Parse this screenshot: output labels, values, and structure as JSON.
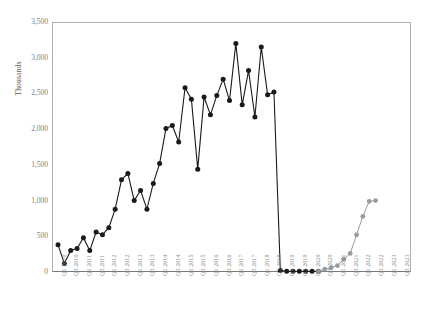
{
  "chart_data": {
    "type": "line",
    "title": "",
    "xlabel": "",
    "ylabel": "Thousands",
    "ylim": [
      0,
      3500
    ],
    "yticks": [
      "0",
      "500",
      "1,000",
      "1,500",
      "2,000",
      "2,500",
      "3,000",
      "3,500"
    ],
    "ytick_values": [
      0,
      500,
      1000,
      1500,
      2000,
      2500,
      3000,
      3500
    ],
    "grid": false,
    "legend": "none",
    "x": [
      "Q1 2010",
      "Q2 2010",
      "Q3 2010",
      "Q4 2010",
      "Q1 2011",
      "Q2 2011",
      "Q3 2011",
      "Q4 2011",
      "Q1 2012",
      "Q2 2012",
      "Q3 2012",
      "Q4 2012",
      "Q1 2013",
      "Q2 2013",
      "Q3 2013",
      "Q4 2013",
      "Q1 2014",
      "Q2 2014",
      "Q3 2014",
      "Q4 2014",
      "Q1 2015",
      "Q2 2015",
      "Q3 2015",
      "Q4 2015",
      "Q1 2016",
      "Q2 2016",
      "Q3 2016",
      "Q4 2016",
      "Q1 2017",
      "Q2 2017",
      "Q3 2017",
      "Q4 2017",
      "Q1 2018",
      "Q2 2018",
      "Q3 2018",
      "Q4 2018",
      "Q1 2019",
      "Q2 2019",
      "Q3 2019",
      "Q4 2019",
      "Q1 2020",
      "Q2 2020",
      "Q3 2020",
      "Q4 2020",
      "Q1 2021",
      "Q2 2021",
      "Q3 2021",
      "Q4 2021",
      "Q1 2022",
      "Q2 2022",
      "Q3 2022",
      "Q4 2022",
      "Q1 2023",
      "Q2 2023",
      "Q3 2023"
    ],
    "xtick_labels": [
      "Q1 2010",
      "Q3 2010",
      "Q1 2011",
      "Q3 2011",
      "Q1 2012",
      "Q3 2012",
      "Q1 2013",
      "Q3 2013",
      "Q1 2014",
      "Q3 2014",
      "Q1 2015",
      "Q3 2015",
      "Q1 2016",
      "Q3 2016",
      "Q1 2017",
      "Q3 2017",
      "Q1 2018",
      "Q3 2018",
      "Q1 2019",
      "Q3 2019",
      "Q1 2020",
      "Q3 2020",
      "Q1 2021",
      "Q3 2021",
      "Q1 2022",
      "Q3 2022",
      "Q1 2023",
      "Q3 2023"
    ],
    "series": [
      {
        "name": "actual",
        "color": "#1a1a1a",
        "marker": "circle-filled",
        "values": [
          380,
          120,
          300,
          330,
          480,
          300,
          560,
          520,
          620,
          880,
          1290,
          1380,
          1000,
          1140,
          880,
          1240,
          1520,
          2010,
          2050,
          1820,
          2580,
          2420,
          1440,
          2450,
          2200,
          2470,
          2700,
          2400,
          3200,
          2340,
          2820,
          2170,
          3150,
          2480,
          2520,
          20,
          10,
          10,
          10,
          10,
          10,
          10,
          null,
          null,
          null,
          null,
          null,
          null,
          null,
          null,
          null,
          null,
          null,
          null,
          null
        ]
      },
      {
        "name": "projected",
        "color": "#9a9a9a",
        "marker": "circle-filled",
        "values": [
          null,
          null,
          null,
          null,
          null,
          null,
          null,
          null,
          null,
          null,
          null,
          null,
          null,
          null,
          null,
          null,
          null,
          null,
          null,
          null,
          null,
          null,
          null,
          null,
          null,
          null,
          null,
          null,
          null,
          null,
          null,
          null,
          null,
          null,
          null,
          null,
          null,
          null,
          null,
          null,
          null,
          10,
          40,
          60,
          90,
          180,
          260,
          520,
          780,
          990,
          1000,
          null,
          null,
          null,
          null
        ]
      }
    ]
  }
}
